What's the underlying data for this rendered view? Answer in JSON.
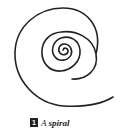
{
  "figure": {
    "number": "1",
    "caption_prefix": "A",
    "caption_emph": "spiral",
    "stroke_color": "#222222"
  }
}
